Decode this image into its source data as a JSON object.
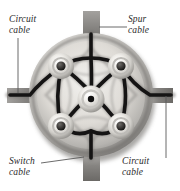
{
  "figure": {
    "background_color": "#ffffff",
    "box": {
      "shape": "circle",
      "center_x": 91,
      "center_y": 95,
      "radius": 62,
      "body_color": "#b9b7b4",
      "rim_color": "#6d6b69",
      "inner_color": "#d9d7d3",
      "shadow_color": "#8e8c8a",
      "wire_color": "#1a1a1a"
    },
    "cable_entries": [
      {
        "name": "top-entry",
        "label_ref": "spur",
        "color": "#8a8885",
        "x": 84,
        "y": 12,
        "w": 16,
        "h": 30
      },
      {
        "name": "left-entry",
        "label_ref": "circuit-top-left",
        "color": "#8a8885",
        "x": 8,
        "y": 88,
        "w": 32,
        "h": 15
      },
      {
        "name": "right-entry",
        "label_ref": "circuit-bottom-right",
        "color": "#8a8885",
        "x": 140,
        "y": 88,
        "w": 33,
        "h": 15
      },
      {
        "name": "bottom-entry",
        "label_ref": "switch",
        "color": "#8a8885",
        "x": 84,
        "y": 150,
        "w": 16,
        "h": 30
      }
    ],
    "terminals": [
      {
        "name": "terminal-top-left",
        "cx": 61,
        "cy": 66,
        "r": 13
      },
      {
        "name": "terminal-top-right",
        "cx": 121,
        "cy": 66,
        "r": 13
      },
      {
        "name": "terminal-bottom-left",
        "cx": 61,
        "cy": 126,
        "r": 13
      },
      {
        "name": "terminal-bottom-right",
        "cx": 121,
        "cy": 126,
        "r": 13
      },
      {
        "name": "terminal-center",
        "cx": 91,
        "cy": 99,
        "r": 13
      }
    ],
    "labels": {
      "circuit_top_left": "Circuit\ncable",
      "spur_top_right": "Spur\ncable",
      "switch_bottom_left": "Switch\ncable",
      "circuit_bottom_right": "Circuit\ncable"
    },
    "leaders": [
      {
        "name": "leader-circuit-top-left",
        "x1": 18,
        "y1": 38,
        "x2": 18,
        "y2": 93
      },
      {
        "name": "leader-spur-top-right",
        "x1": 127,
        "y1": 27,
        "x2": 99,
        "y2": 27
      },
      {
        "name": "leader-switch-bottom-left",
        "x1": 41,
        "y1": 162,
        "x2": 84,
        "y2": 157
      },
      {
        "name": "leader-circuit-bottom-right",
        "x1": 166,
        "y1": 96,
        "x2": 166,
        "y2": 158
      }
    ],
    "leader_color": "#5a5a5a"
  }
}
